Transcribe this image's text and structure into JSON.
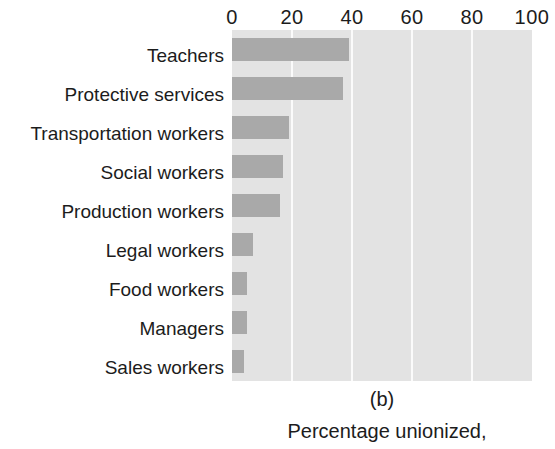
{
  "chart_data": {
    "type": "bar",
    "orientation": "horizontal",
    "title": "",
    "subtitle": "",
    "panel_letter": "(b)",
    "caption": "Percentage unionized,",
    "xlabel": "",
    "ylabel": "",
    "categories": [
      "Teachers",
      "Protective services",
      "Transportation workers",
      "Social workers",
      "Production workers",
      "Legal workers",
      "Food workers",
      "Managers",
      "Sales workers"
    ],
    "values": [
      39,
      37,
      19,
      17,
      16,
      7,
      5,
      5,
      4
    ],
    "xlim": [
      0,
      100
    ],
    "xticks": [
      0,
      20,
      40,
      60,
      80,
      100
    ],
    "xtick_labels": [
      "0",
      "20",
      "40",
      "60",
      "80",
      "100"
    ],
    "grid": true,
    "grid_axis": "x",
    "legend": null,
    "colors": {
      "bar": "#a9a9a9",
      "plot_background": "#e3e3e3",
      "gridline": "#fbfbfb",
      "page_background": "#ffffff",
      "text": "#1c1c1c"
    }
  }
}
